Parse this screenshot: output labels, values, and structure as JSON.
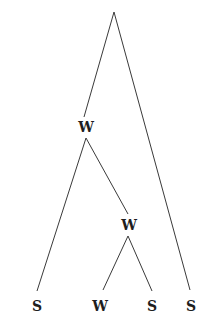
{
  "diagram": {
    "type": "metrical-tree",
    "root": {
      "x": 114,
      "y": 12,
      "label": ""
    },
    "nodes": [
      {
        "id": "w1",
        "label": "W",
        "x": 86,
        "y": 127
      },
      {
        "id": "w2",
        "label": "W",
        "x": 129,
        "y": 225
      },
      {
        "id": "s1",
        "label": "S",
        "x": 37,
        "y": 306
      },
      {
        "id": "w3",
        "label": "W",
        "x": 100,
        "y": 306
      },
      {
        "id": "s3",
        "label": "S",
        "x": 152,
        "y": 306
      },
      {
        "id": "s4",
        "label": "S",
        "x": 191,
        "y": 306
      }
    ],
    "edges": [
      {
        "from": "root",
        "to": "w1",
        "x1": 114,
        "y1": 12,
        "x2": 84,
        "y2": 117
      },
      {
        "from": "root",
        "to": "s4",
        "x1": 114,
        "y1": 12,
        "x2": 190,
        "y2": 290
      },
      {
        "from": "w1",
        "to": "s1",
        "x1": 86,
        "y1": 138,
        "x2": 37,
        "y2": 291
      },
      {
        "from": "w1",
        "to": "w2",
        "x1": 86,
        "y1": 138,
        "x2": 128,
        "y2": 214
      },
      {
        "from": "w2",
        "to": "w3",
        "x1": 128,
        "y1": 236,
        "x2": 103,
        "y2": 290
      },
      {
        "from": "w2",
        "to": "s3",
        "x1": 128,
        "y1": 236,
        "x2": 152,
        "y2": 291
      }
    ],
    "leaves_in_order": [
      "S",
      "W",
      "S",
      "S"
    ],
    "colors": {
      "line": "#3a3a3a",
      "text": "#1e1e1e",
      "background": "#ffffff"
    }
  }
}
